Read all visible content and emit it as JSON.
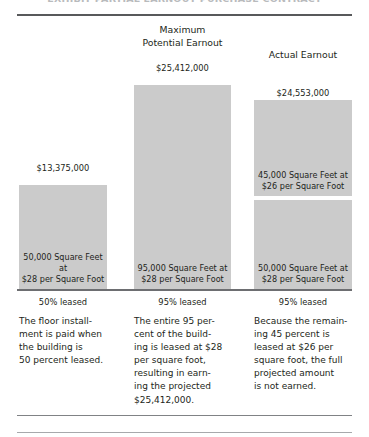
{
  "figure": {
    "clipped_title": "EXHIBIT  PARTIAL EARNOUT PURCHASE CONTRACT"
  },
  "chart_data": {
    "type": "bar",
    "title": "",
    "xlabel": "",
    "ylabel": "",
    "grid": false,
    "legend": "none",
    "ylim": [
      0,
      25412000
    ],
    "categories": [
      "50% leased",
      "95% leased",
      "95% leased"
    ],
    "columns": [
      {
        "header": "",
        "value_label": "$13,375,000",
        "value": 13375000,
        "category": "50% leased",
        "segments": [
          {
            "label": "50,000 Square Feet at\n$28 per Square Foot",
            "square_feet": 50000,
            "rate_per_square_foot": 28,
            "value": 13375000
          }
        ],
        "caption": "The floor install-\nment is paid when\nthe building is\n50 percent leased."
      },
      {
        "header": "Maximum\nPotential Earnout",
        "value_label": "$25,412,000",
        "value": 25412000,
        "category": "95% leased",
        "segments": [
          {
            "label": "95,000 Square Feet at\n$28 per Square Foot",
            "square_feet": 95000,
            "rate_per_square_foot": 28,
            "value": 25412000
          }
        ],
        "caption": "The entire 95 per-\ncent of the build-\ning is leased at $28\nper square foot,\nresulting in earn-\ning the projected\n$25,412,000."
      },
      {
        "header": "Actual Earnout",
        "value_label": "$24,553,000",
        "value": 24553000,
        "category": "95% leased",
        "segments": [
          {
            "label": "45,000 Square Feet at\n$26 per Square Foot",
            "square_feet": 45000,
            "rate_per_square_foot": 26,
            "position": "upper"
          },
          {
            "label": "50,000 Square Feet at\n$28 per Square Foot",
            "square_feet": 50000,
            "rate_per_square_foot": 28,
            "position": "lower"
          }
        ],
        "caption": "Because the remain-\ning 45 percent is\nleased at $26 per\nsquare foot, the full\nprojected amount\nis not earned."
      }
    ],
    "colors": {
      "bar_fill": "#cbcbcb",
      "text": "#231f20",
      "rule": "#6d6e71"
    }
  }
}
